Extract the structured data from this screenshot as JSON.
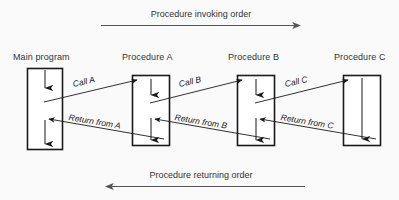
{
  "diagram": {
    "title_top": "Procedure invoking order",
    "title_bottom": "Procedure returning order",
    "background_color": "#fafafa",
    "stroke_color": "#1a1a1a",
    "arrow_color": "#444444",
    "columns": [
      {
        "id": "main",
        "label": "Main program"
      },
      {
        "id": "proc-a",
        "label": "Procedure A"
      },
      {
        "id": "proc-b",
        "label": "Procedure B"
      },
      {
        "id": "proc-c",
        "label": "Procedure C"
      }
    ],
    "call_edges": [
      {
        "id": "call-a",
        "label": "Call A",
        "from": "main",
        "to": "proc-a"
      },
      {
        "id": "call-b",
        "label": "Call B",
        "from": "proc-a",
        "to": "proc-b"
      },
      {
        "id": "call-c",
        "label": "Call C",
        "from": "proc-b",
        "to": "proc-c"
      }
    ],
    "return_edges": [
      {
        "id": "return-a",
        "label": "Return from A",
        "from": "proc-a",
        "to": "main"
      },
      {
        "id": "return-b",
        "label": "Return from B",
        "from": "proc-b",
        "to": "proc-a"
      },
      {
        "id": "return-c",
        "label": "Return from C",
        "from": "proc-c",
        "to": "proc-b"
      }
    ]
  }
}
